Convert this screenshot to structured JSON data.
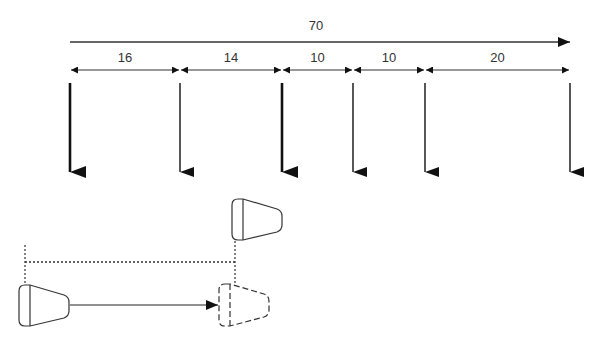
{
  "diagram": {
    "total": {
      "label": "70",
      "x1": 70,
      "x2": 570,
      "y": 42,
      "label_x": 316,
      "label_y": 30
    },
    "segments": [
      {
        "label": "16",
        "x1": 70,
        "x2": 180
      },
      {
        "label": "14",
        "x1": 180,
        "x2": 282
      },
      {
        "label": "10",
        "x1": 282,
        "x2": 353
      },
      {
        "label": "10",
        "x1": 353,
        "x2": 425
      },
      {
        "label": "20",
        "x1": 425,
        "x2": 570
      }
    ],
    "segment_y": 70,
    "segment_label_y": 62,
    "drop_arrows": [
      {
        "x": 70,
        "weight": "bold"
      },
      {
        "x": 180,
        "weight": "normal"
      },
      {
        "x": 282,
        "weight": "bold"
      },
      {
        "x": 353,
        "weight": "normal"
      },
      {
        "x": 425,
        "weight": "normal"
      },
      {
        "x": 570,
        "weight": "normal"
      }
    ],
    "drop_y1": 83,
    "drop_y2": 172,
    "cups": [
      {
        "id": "raised",
        "x": 231,
        "y": 199,
        "style": "solid"
      },
      {
        "id": "start",
        "x": 18,
        "y": 285,
        "style": "solid"
      },
      {
        "id": "target",
        "x": 218,
        "y": 284,
        "style": "dashed"
      }
    ],
    "colors": {
      "line": "#222222",
      "text": "#333333"
    }
  }
}
